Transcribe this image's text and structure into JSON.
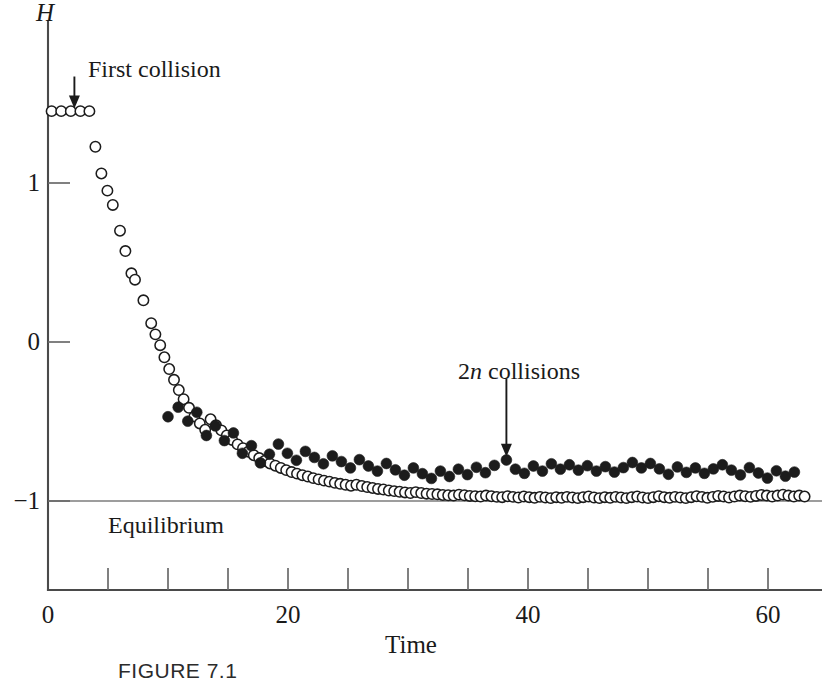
{
  "figure": {
    "caption": "FIGURE  7.1"
  },
  "chart_data": {
    "type": "scatter",
    "title": "",
    "xlabel": "Time",
    "ylabel": "H",
    "xlim": [
      0,
      65
    ],
    "ylim": [
      -1.6,
      1.75
    ],
    "grid": false,
    "legend_position": "none",
    "x_ticks_labeled": [
      {
        "value": 0,
        "label": "0"
      },
      {
        "value": 20,
        "label": "20"
      },
      {
        "value": 40,
        "label": "40"
      },
      {
        "value": 60,
        "label": "60"
      }
    ],
    "x_ticks_minor": [
      5,
      10,
      15,
      25,
      30,
      35,
      45,
      50,
      55,
      65
    ],
    "y_ticks_labeled": [
      {
        "value": 1,
        "label": "1"
      },
      {
        "value": 0,
        "label": "0"
      },
      {
        "value": -1,
        "label": "−1"
      }
    ],
    "reference_lines": [
      {
        "name": "equilibrium",
        "axis": "y",
        "value": -1,
        "label": "Equilibrium"
      }
    ],
    "annotations": [
      {
        "text": "First collision",
        "text_html": "First collision",
        "point_x": 2.2,
        "point_y": 1.45,
        "label_x": 3.0,
        "label_y": 1.72
      },
      {
        "text": "2n collisions",
        "text_html": "2<i>n</i> collisions",
        "point_x": 38.2,
        "point_y": -0.74,
        "label_x": 34.0,
        "label_y": -0.18
      }
    ],
    "series": [
      {
        "name": "open-circles",
        "marker": "open-circle",
        "points": [
          [
            0.3,
            1.452
          ],
          [
            1.1,
            1.452
          ],
          [
            1.9,
            1.452
          ],
          [
            2.7,
            1.452
          ],
          [
            3.45,
            1.452
          ],
          [
            3.95,
            1.228
          ],
          [
            4.45,
            1.06
          ],
          [
            4.95,
            0.952
          ],
          [
            5.4,
            0.862
          ],
          [
            6.0,
            0.7
          ],
          [
            6.45,
            0.572
          ],
          [
            6.95,
            0.432
          ],
          [
            7.25,
            0.392
          ],
          [
            7.95,
            0.262
          ],
          [
            8.6,
            0.118
          ],
          [
            8.95,
            0.048
          ],
          [
            9.35,
            -0.02
          ],
          [
            9.7,
            -0.096
          ],
          [
            10.1,
            -0.17
          ],
          [
            10.5,
            -0.238
          ],
          [
            10.9,
            -0.302
          ],
          [
            11.3,
            -0.36
          ],
          [
            11.75,
            -0.414
          ],
          [
            12.2,
            -0.468
          ],
          [
            12.65,
            -0.512
          ],
          [
            13.1,
            -0.552
          ],
          [
            13.55,
            -0.486
          ],
          [
            14.0,
            -0.524
          ],
          [
            14.45,
            -0.556
          ],
          [
            14.9,
            -0.588
          ],
          [
            15.35,
            -0.616
          ],
          [
            15.8,
            -0.644
          ],
          [
            16.25,
            -0.668
          ],
          [
            16.7,
            -0.69
          ],
          [
            17.15,
            -0.712
          ],
          [
            17.6,
            -0.73
          ],
          [
            18.05,
            -0.748
          ],
          [
            18.5,
            -0.764
          ],
          [
            18.95,
            -0.778
          ],
          [
            19.4,
            -0.792
          ],
          [
            19.85,
            -0.806
          ],
          [
            20.3,
            -0.818
          ],
          [
            20.75,
            -0.828
          ],
          [
            21.2,
            -0.838
          ],
          [
            21.65,
            -0.846
          ],
          [
            22.1,
            -0.856
          ],
          [
            22.55,
            -0.864
          ],
          [
            23.0,
            -0.872
          ],
          [
            23.45,
            -0.878
          ],
          [
            23.9,
            -0.886
          ],
          [
            24.35,
            -0.892
          ],
          [
            24.8,
            -0.898
          ],
          [
            25.25,
            -0.904
          ],
          [
            25.7,
            -0.898
          ],
          [
            26.15,
            -0.906
          ],
          [
            26.6,
            -0.912
          ],
          [
            27.05,
            -0.918
          ],
          [
            27.5,
            -0.924
          ],
          [
            27.95,
            -0.928
          ],
          [
            28.4,
            -0.934
          ],
          [
            28.85,
            -0.938
          ],
          [
            29.3,
            -0.942
          ],
          [
            29.75,
            -0.946
          ],
          [
            30.2,
            -0.95
          ],
          [
            30.65,
            -0.944
          ],
          [
            31.1,
            -0.95
          ],
          [
            31.55,
            -0.954
          ],
          [
            32.0,
            -0.956
          ],
          [
            32.45,
            -0.958
          ],
          [
            32.9,
            -0.962
          ],
          [
            33.35,
            -0.964
          ],
          [
            33.8,
            -0.966
          ],
          [
            34.25,
            -0.96
          ],
          [
            34.7,
            -0.964
          ],
          [
            35.15,
            -0.968
          ],
          [
            35.6,
            -0.97
          ],
          [
            36.05,
            -0.972
          ],
          [
            36.5,
            -0.966
          ],
          [
            36.95,
            -0.97
          ],
          [
            37.4,
            -0.974
          ],
          [
            37.85,
            -0.976
          ],
          [
            38.3,
            -0.97
          ],
          [
            38.75,
            -0.974
          ],
          [
            39.2,
            -0.978
          ],
          [
            39.65,
            -0.972
          ],
          [
            40.1,
            -0.976
          ],
          [
            40.55,
            -0.98
          ],
          [
            41.0,
            -0.974
          ],
          [
            41.45,
            -0.978
          ],
          [
            41.9,
            -0.982
          ],
          [
            42.35,
            -0.976
          ],
          [
            42.8,
            -0.98
          ],
          [
            43.25,
            -0.974
          ],
          [
            43.7,
            -0.978
          ],
          [
            44.15,
            -0.982
          ],
          [
            44.6,
            -0.976
          ],
          [
            45.05,
            -0.972
          ],
          [
            45.5,
            -0.978
          ],
          [
            45.95,
            -0.982
          ],
          [
            46.4,
            -0.976
          ],
          [
            46.85,
            -0.98
          ],
          [
            47.3,
            -0.974
          ],
          [
            47.75,
            -0.978
          ],
          [
            48.2,
            -0.982
          ],
          [
            48.65,
            -0.976
          ],
          [
            49.1,
            -0.972
          ],
          [
            49.55,
            -0.978
          ],
          [
            50.0,
            -0.982
          ],
          [
            50.45,
            -0.976
          ],
          [
            50.9,
            -0.97
          ],
          [
            51.35,
            -0.976
          ],
          [
            51.8,
            -0.98
          ],
          [
            52.25,
            -0.974
          ],
          [
            52.7,
            -0.978
          ],
          [
            53.15,
            -0.982
          ],
          [
            53.6,
            -0.976
          ],
          [
            54.05,
            -0.97
          ],
          [
            54.5,
            -0.974
          ],
          [
            54.95,
            -0.98
          ],
          [
            55.4,
            -0.974
          ],
          [
            55.85,
            -0.968
          ],
          [
            56.3,
            -0.972
          ],
          [
            56.75,
            -0.978
          ],
          [
            57.2,
            -0.972
          ],
          [
            57.65,
            -0.966
          ],
          [
            58.1,
            -0.97
          ],
          [
            58.55,
            -0.974
          ],
          [
            59.0,
            -0.968
          ],
          [
            59.45,
            -0.962
          ],
          [
            59.9,
            -0.966
          ],
          [
            60.35,
            -0.972
          ],
          [
            60.8,
            -0.966
          ],
          [
            61.25,
            -0.96
          ],
          [
            61.7,
            -0.966
          ],
          [
            62.15,
            -0.972
          ],
          [
            62.6,
            -0.966
          ],
          [
            63.05,
            -0.972
          ]
        ]
      },
      {
        "name": "filled-circles",
        "marker": "filled-circle",
        "points": [
          [
            10.0,
            -0.47
          ],
          [
            10.85,
            -0.41
          ],
          [
            11.65,
            -0.498
          ],
          [
            12.4,
            -0.442
          ],
          [
            13.2,
            -0.588
          ],
          [
            13.95,
            -0.528
          ],
          [
            14.7,
            -0.62
          ],
          [
            15.45,
            -0.572
          ],
          [
            16.2,
            -0.7
          ],
          [
            16.95,
            -0.652
          ],
          [
            17.7,
            -0.76
          ],
          [
            18.45,
            -0.706
          ],
          [
            19.2,
            -0.642
          ],
          [
            19.95,
            -0.7
          ],
          [
            20.7,
            -0.744
          ],
          [
            21.45,
            -0.688
          ],
          [
            22.2,
            -0.726
          ],
          [
            22.95,
            -0.766
          ],
          [
            23.7,
            -0.716
          ],
          [
            24.45,
            -0.752
          ],
          [
            25.2,
            -0.792
          ],
          [
            25.95,
            -0.74
          ],
          [
            26.7,
            -0.78
          ],
          [
            27.45,
            -0.812
          ],
          [
            28.2,
            -0.764
          ],
          [
            28.95,
            -0.804
          ],
          [
            29.7,
            -0.838
          ],
          [
            30.45,
            -0.792
          ],
          [
            31.2,
            -0.828
          ],
          [
            31.95,
            -0.858
          ],
          [
            32.7,
            -0.812
          ],
          [
            33.45,
            -0.846
          ],
          [
            34.2,
            -0.8
          ],
          [
            34.95,
            -0.834
          ],
          [
            35.7,
            -0.788
          ],
          [
            36.45,
            -0.822
          ],
          [
            37.2,
            -0.776
          ],
          [
            38.2,
            -0.742
          ],
          [
            38.95,
            -0.8
          ],
          [
            39.7,
            -0.826
          ],
          [
            40.45,
            -0.78
          ],
          [
            41.2,
            -0.812
          ],
          [
            41.95,
            -0.766
          ],
          [
            42.7,
            -0.8
          ],
          [
            43.45,
            -0.772
          ],
          [
            44.2,
            -0.806
          ],
          [
            44.95,
            -0.778
          ],
          [
            45.7,
            -0.812
          ],
          [
            46.45,
            -0.784
          ],
          [
            47.2,
            -0.818
          ],
          [
            47.95,
            -0.79
          ],
          [
            48.7,
            -0.758
          ],
          [
            49.45,
            -0.792
          ],
          [
            50.2,
            -0.764
          ],
          [
            50.95,
            -0.798
          ],
          [
            51.7,
            -0.832
          ],
          [
            52.45,
            -0.786
          ],
          [
            53.2,
            -0.82
          ],
          [
            53.95,
            -0.792
          ],
          [
            54.7,
            -0.826
          ],
          [
            55.45,
            -0.798
          ],
          [
            56.2,
            -0.772
          ],
          [
            56.95,
            -0.806
          ],
          [
            57.7,
            -0.836
          ],
          [
            58.45,
            -0.79
          ],
          [
            59.2,
            -0.824
          ],
          [
            59.95,
            -0.856
          ],
          [
            60.7,
            -0.81
          ],
          [
            61.45,
            -0.844
          ],
          [
            62.2,
            -0.818
          ]
        ]
      }
    ]
  }
}
